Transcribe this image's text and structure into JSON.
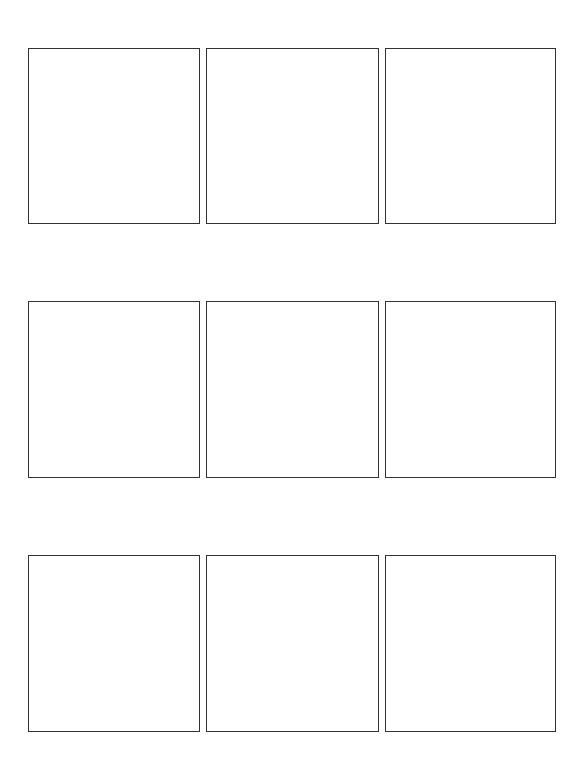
{
  "document": {
    "type": "storyboard-template",
    "layout": "3x3 grid",
    "border_color": "#333333",
    "background_color": "#ffffff"
  },
  "panels": [
    {
      "index": 1,
      "row": 1,
      "column": 1,
      "content": ""
    },
    {
      "index": 2,
      "row": 1,
      "column": 2,
      "content": ""
    },
    {
      "index": 3,
      "row": 1,
      "column": 3,
      "content": ""
    },
    {
      "index": 4,
      "row": 2,
      "column": 1,
      "content": ""
    },
    {
      "index": 5,
      "row": 2,
      "column": 2,
      "content": ""
    },
    {
      "index": 6,
      "row": 2,
      "column": 3,
      "content": ""
    },
    {
      "index": 7,
      "row": 3,
      "column": 1,
      "content": ""
    },
    {
      "index": 8,
      "row": 3,
      "column": 2,
      "content": ""
    },
    {
      "index": 9,
      "row": 3,
      "column": 3,
      "content": ""
    }
  ]
}
